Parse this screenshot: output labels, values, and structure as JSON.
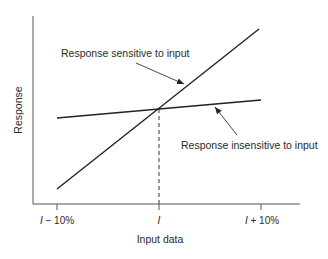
{
  "diagram": {
    "y_axis_label": "Response",
    "x_axis_label": "Input data",
    "ticks": [
      {
        "prefix": "I",
        "suffix": " − 10%"
      },
      {
        "prefix": "I",
        "suffix": ""
      },
      {
        "prefix": "I",
        "suffix": " + 10%"
      }
    ],
    "annotations": {
      "sensitive": "Response sensitive to input",
      "insensitive": "Response insensitive to input"
    },
    "colors": {
      "line": "#222222",
      "axis": "#555555",
      "text": "#2a2a2a"
    }
  }
}
